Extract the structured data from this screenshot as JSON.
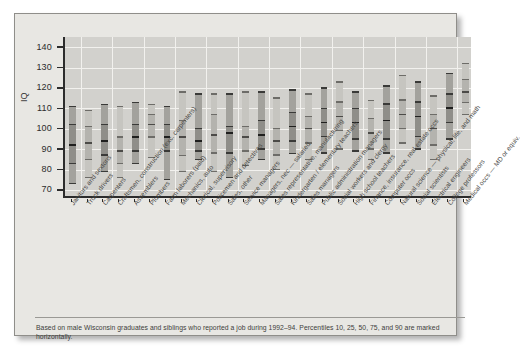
{
  "chart_data": {
    "type": "box",
    "title": "",
    "xlabel": "",
    "ylabel": "IQ",
    "ylim": [
      66,
      145
    ],
    "yticks": [
      70,
      80,
      90,
      100,
      110,
      120,
      130,
      140
    ],
    "grid": true,
    "legend": "none",
    "percentile_levels": [
      10,
      25,
      50,
      75,
      90
    ],
    "caption": "Based on male Wisconsin graduates and siblings who reported a job during 1992–94. Percentiles 10, 25, 50, 75, and 90 are marked horizontally.",
    "categories": [
      "Janitors and sextons",
      "Truck drivers",
      "Carpenters",
      "Craftsmen, construction (exc. carpenters)",
      "Assemblers",
      "Plumbers",
      "Farm laborers (paid)",
      "Mechanics, auto",
      "Clerical, supervisory",
      "Policemen and detectives",
      "Sales, other",
      "Service managers",
      "Managers, nec — salaried",
      "Sales representative, manufacturing",
      "Kindergarten / elementary teachers",
      "Sales managers",
      "Public administration managers",
      "Social workers and clergy",
      "High school teachers",
      "Finance, insurance, real estate occs",
      "Computer occs",
      "Natural science — physical, life, and math",
      "Social scientists",
      "Electrical engineers",
      "College professors",
      "Medical occs — MD or equiv."
    ],
    "series": [
      {
        "name": "p10",
        "values": [
          73,
          76,
          79,
          76,
          83,
          86,
          75,
          79,
          85,
          79,
          76,
          82,
          85,
          80,
          88,
          85,
          88,
          90,
          89,
          85,
          88,
          93,
          90,
          85,
          95,
          107
        ]
      },
      {
        "name": "p25",
        "values": [
          83,
          85,
          87,
          83,
          89,
          96,
          89,
          87,
          89,
          88,
          88,
          89,
          90,
          87,
          94,
          93,
          96,
          99,
          95,
          90,
          95,
          100,
          96,
          92,
          103,
          113
        ]
      },
      {
        "name": "p50",
        "values": [
          92,
          93,
          94,
          89,
          96,
          102,
          96,
          96,
          94,
          97,
          98,
          96,
          97,
          94,
          101,
          100,
          103,
          106,
          103,
          98,
          104,
          107,
          106,
          100,
          110,
          118
        ]
      },
      {
        "name": "p75",
        "values": [
          102,
          101,
          102,
          96,
          102,
          107,
          102,
          104,
          100,
          107,
          101,
          101,
          104,
          100,
          108,
          106,
          110,
          113,
          110,
          105,
          112,
          114,
          113,
          107,
          117,
          124
        ]
      },
      {
        "name": "p90",
        "values": [
          111,
          109,
          112,
          111,
          113,
          112,
          111,
          118,
          117,
          117,
          117,
          118,
          118,
          115,
          119,
          117,
          120,
          123,
          118,
          114,
          121,
          126,
          123,
          116,
          127,
          132
        ]
      }
    ]
  },
  "axis": {
    "y_label": "IQ",
    "y_ticks": [
      "140",
      "130",
      "120",
      "110",
      "100",
      "90",
      "80",
      "70"
    ]
  },
  "caption": {
    "text": "Based on male Wisconsin graduates and siblings who reported a job during 1992–94. Percentiles 10, 25, 50, 75, and 90 are marked horizontally."
  }
}
